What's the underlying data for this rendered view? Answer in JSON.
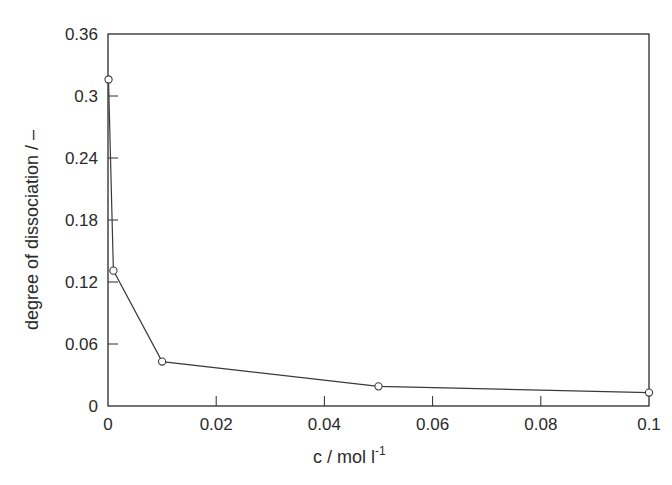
{
  "chart_data": {
    "type": "line",
    "title": "",
    "xlabel": "c / mol l",
    "xlabel_superscript": "-1",
    "ylabel": "degree of dissociation / –",
    "xlim": [
      0,
      0.1
    ],
    "ylim": [
      0,
      0.36
    ],
    "x_ticks": [
      "0",
      "0.02",
      "0.04",
      "0.06",
      "0.08",
      "0.1"
    ],
    "x_tick_values": [
      0,
      0.02,
      0.04,
      0.06,
      0.08,
      0.1
    ],
    "y_ticks": [
      "0",
      "0.06",
      "0.12",
      "0.18",
      "0.24",
      "0.3",
      "0.36"
    ],
    "y_tick_values": [
      0,
      0.06,
      0.12,
      0.18,
      0.24,
      0.3,
      0.36
    ],
    "grid": false,
    "legend": null,
    "series": [
      {
        "name": "degree of dissociation",
        "marker": "open-circle",
        "color": "#2a2a2a",
        "x": [
          0.0001,
          0.001,
          0.01,
          0.05,
          0.1
        ],
        "y": [
          0.316,
          0.131,
          0.043,
          0.019,
          0.013
        ]
      }
    ]
  },
  "colors": {
    "axis": "#2a2a2a",
    "line": "#3a3a3a",
    "background": "#ffffff"
  }
}
